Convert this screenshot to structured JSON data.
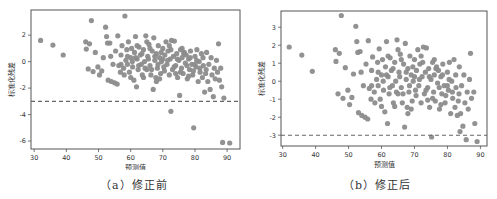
{
  "colors": {
    "point": "#8c8c8c",
    "axis": "#555555",
    "dashed_line": "#666666",
    "text": "#333333"
  },
  "chart_data": [
    {
      "id": "a",
      "type": "scatter",
      "title": "",
      "caption": "（a）修正前",
      "xlabel": "预测值",
      "ylabel": "标准化残差",
      "xlim": [
        29,
        94
      ],
      "ylim": [
        -6.6,
        3.9
      ],
      "xticks": [
        30,
        40,
        50,
        60,
        70,
        80,
        90
      ],
      "yticks": [
        2,
        0,
        -2,
        -4,
        -6
      ],
      "grid": false,
      "legend": null,
      "reference_line": {
        "y": -3,
        "style": "dashed"
      },
      "points": [
        [
          32,
          1.6
        ],
        [
          35.8,
          1.25
        ],
        [
          39,
          0.5
        ],
        [
          46,
          1.5
        ],
        [
          46.2,
          0.95
        ],
        [
          46.8,
          -0.55
        ],
        [
          47.2,
          1.35
        ],
        [
          47.8,
          3.1
        ],
        [
          48.3,
          -0.75
        ],
        [
          49,
          0.7
        ],
        [
          49.8,
          -0.4
        ],
        [
          50.3,
          -1.0
        ],
        [
          51,
          -0.7
        ],
        [
          51.5,
          0.3
        ],
        [
          52.2,
          2.6
        ],
        [
          52.5,
          1.9
        ],
        [
          52.8,
          1.4
        ],
        [
          53,
          -1.4
        ],
        [
          53.5,
          1.4
        ],
        [
          53.8,
          0.4
        ],
        [
          54,
          -1.5
        ],
        [
          54.5,
          -0.2
        ],
        [
          55,
          -1.6
        ],
        [
          55.3,
          0.8
        ],
        [
          55.8,
          -1.7
        ],
        [
          56,
          1.95
        ],
        [
          56.3,
          -0.3
        ],
        [
          56.8,
          -0.8
        ],
        [
          57,
          0.5
        ],
        [
          57.3,
          1.2
        ],
        [
          57.8,
          -0.5
        ],
        [
          58.2,
          3.45
        ],
        [
          58.5,
          0.1
        ],
        [
          58.8,
          0.9
        ],
        [
          59,
          -0.2
        ],
        [
          59.3,
          1.5
        ],
        [
          59.6,
          -0.8
        ],
        [
          60,
          0.3
        ],
        [
          60.3,
          1.0
        ],
        [
          60.6,
          -0.4
        ],
        [
          61,
          -1.4
        ],
        [
          61.2,
          0.7
        ],
        [
          61.5,
          1.9
        ],
        [
          61.8,
          -1.9
        ],
        [
          62,
          0.2
        ],
        [
          62.3,
          -0.6
        ],
        [
          62.6,
          1.1
        ],
        [
          63,
          0.5
        ],
        [
          63.3,
          -0.2
        ],
        [
          63.6,
          -1.0
        ],
        [
          64,
          0.9
        ],
        [
          64.3,
          0.0
        ],
        [
          64.7,
          1.95
        ],
        [
          65,
          -0.6
        ],
        [
          65.3,
          0.4
        ],
        [
          65.7,
          1.3
        ],
        [
          66,
          -0.3
        ],
        [
          66.3,
          -1.0
        ],
        [
          66.7,
          0.8
        ],
        [
          67,
          -2.1
        ],
        [
          67.2,
          1.8
        ],
        [
          67.5,
          0.1
        ],
        [
          67.8,
          -1.2
        ],
        [
          68,
          0.6
        ],
        [
          68.3,
          -0.5
        ],
        [
          68.6,
          1.2
        ],
        [
          69,
          0.3
        ],
        [
          69.3,
          -0.9
        ],
        [
          69.6,
          0.0
        ],
        [
          70,
          1.0
        ],
        [
          70.3,
          -0.4
        ],
        [
          70.6,
          0.5
        ],
        [
          71,
          1.5
        ],
        [
          71.3,
          -0.2
        ],
        [
          71.6,
          0.8
        ],
        [
          72,
          -1.0
        ],
        [
          72.3,
          0.2
        ],
        [
          72.5,
          -3.75
        ],
        [
          72.7,
          1.6
        ],
        [
          73,
          -0.6
        ],
        [
          73.3,
          0.4
        ],
        [
          73.6,
          1.55
        ],
        [
          74,
          -0.3
        ],
        [
          74.3,
          0.6
        ],
        [
          74.6,
          -1.2
        ],
        [
          75,
          0.1
        ],
        [
          75.2,
          -2.55
        ],
        [
          75.5,
          0.9
        ],
        [
          75.8,
          -0.5
        ],
        [
          76,
          0.3
        ],
        [
          76.3,
          -0.9
        ],
        [
          76.7,
          0.7
        ],
        [
          77,
          -0.1
        ],
        [
          77.3,
          0.5
        ],
        [
          77.6,
          -1.3
        ],
        [
          78,
          0.2
        ],
        [
          78.3,
          -0.6
        ],
        [
          78.6,
          0.8
        ],
        [
          79,
          -0.2
        ],
        [
          79.3,
          -1.0
        ],
        [
          79.6,
          -5.0
        ],
        [
          80,
          0.4
        ],
        [
          80.3,
          -0.4
        ],
        [
          80.6,
          0.9
        ],
        [
          81,
          -1.5
        ],
        [
          81.3,
          0.0
        ],
        [
          81.6,
          -0.8
        ],
        [
          82,
          0.6
        ],
        [
          82.3,
          -1.2
        ],
        [
          82.6,
          -0.3
        ],
        [
          83,
          -2.3
        ],
        [
          83.3,
          -0.9
        ],
        [
          83.6,
          0.7
        ],
        [
          84,
          -1.5
        ],
        [
          84.3,
          -0.2
        ],
        [
          84.7,
          -2.1
        ],
        [
          85,
          0.3
        ],
        [
          85.3,
          -1.0
        ],
        [
          85.7,
          -2.65
        ],
        [
          86,
          -0.5
        ],
        [
          86.3,
          -1.3
        ],
        [
          86.7,
          0.1
        ],
        [
          87,
          -0.8
        ],
        [
          87.3,
          1.35
        ],
        [
          87.6,
          -1.4
        ],
        [
          88,
          -0.5
        ],
        [
          88.3,
          -1.9
        ],
        [
          88.6,
          -6.1
        ],
        [
          89,
          -2.75
        ],
        [
          90.8,
          -6.15
        ],
        [
          60.5,
          0.0
        ],
        [
          61.5,
          0.3
        ],
        [
          62.5,
          -0.3
        ],
        [
          63.5,
          0.6
        ],
        [
          64.5,
          -0.5
        ],
        [
          65.5,
          0.2
        ],
        [
          66.5,
          -0.6
        ],
        [
          67.5,
          0.4
        ],
        [
          68.5,
          -0.2
        ],
        [
          69.5,
          0.7
        ],
        [
          70.5,
          -0.7
        ],
        [
          71.5,
          0.1
        ],
        [
          72.5,
          0.9
        ],
        [
          73.5,
          -0.4
        ],
        [
          74.5,
          0.2
        ],
        [
          75.5,
          -0.8
        ],
        [
          76.5,
          0.6
        ],
        [
          77.5,
          -0.3
        ],
        [
          78.5,
          0.3
        ],
        [
          79.5,
          -0.7
        ],
        [
          80.5,
          0.1
        ],
        [
          81.5,
          -0.5
        ],
        [
          82.5,
          0.3
        ],
        [
          83.5,
          -0.6
        ],
        [
          62,
          1.2
        ],
        [
          64,
          -1.2
        ],
        [
          66,
          1.0
        ],
        [
          68,
          -1.5
        ],
        [
          70,
          0.2
        ],
        [
          72,
          1.2
        ],
        [
          74,
          -0.9
        ],
        [
          76,
          1.0
        ],
        [
          78,
          -1.1
        ],
        [
          80,
          -0.2
        ],
        [
          58,
          -1.0
        ],
        [
          57,
          -0.2
        ],
        [
          59,
          0.4
        ],
        [
          60,
          -1.2
        ],
        [
          65,
          1.5
        ],
        [
          69,
          -1.3
        ]
      ]
    },
    {
      "id": "b",
      "type": "scatter",
      "title": "",
      "caption": "（b）修正后",
      "xlabel": "预测值",
      "ylabel": "标准化残差",
      "xlim": [
        29.5,
        92
      ],
      "ylim": [
        -3.6,
        3.9
      ],
      "xticks": [
        30,
        40,
        50,
        60,
        70,
        80,
        90
      ],
      "yticks": [
        3,
        2,
        1,
        0,
        -1,
        -2,
        -3
      ],
      "grid": false,
      "legend": null,
      "reference_line": {
        "y": -3,
        "style": "dashed"
      },
      "points": [
        [
          32,
          1.9
        ],
        [
          35.8,
          1.45
        ],
        [
          39,
          0.55
        ],
        [
          46,
          1.75
        ],
        [
          46.2,
          1.1
        ],
        [
          46.8,
          -0.7
        ],
        [
          47.2,
          1.55
        ],
        [
          47.8,
          3.65
        ],
        [
          48.3,
          -0.95
        ],
        [
          49,
          0.75
        ],
        [
          49.8,
          -0.5
        ],
        [
          50.3,
          -1.3
        ],
        [
          51,
          -0.9
        ],
        [
          51.5,
          0.4
        ],
        [
          52.2,
          3.05
        ],
        [
          52.5,
          2.2
        ],
        [
          52.8,
          1.6
        ],
        [
          53,
          -1.75
        ],
        [
          53.5,
          1.65
        ],
        [
          53.8,
          0.5
        ],
        [
          54,
          -1.9
        ],
        [
          54.5,
          -0.25
        ],
        [
          55,
          -2.0
        ],
        [
          55.3,
          0.95
        ],
        [
          55.8,
          -2.1
        ],
        [
          56,
          2.25
        ],
        [
          56.3,
          -0.4
        ],
        [
          56.8,
          -1.0
        ],
        [
          57,
          0.6
        ],
        [
          57.3,
          1.35
        ],
        [
          57.8,
          -0.6
        ],
        [
          58.5,
          0.1
        ],
        [
          58.8,
          1.05
        ],
        [
          59,
          -0.25
        ],
        [
          59.3,
          1.8
        ],
        [
          59.6,
          -1.0
        ],
        [
          60,
          0.35
        ],
        [
          60.3,
          1.2
        ],
        [
          60.6,
          -0.5
        ],
        [
          61,
          -1.7
        ],
        [
          61.2,
          0.8
        ],
        [
          61.5,
          2.2
        ],
        [
          61.8,
          -2.35
        ],
        [
          62,
          0.25
        ],
        [
          62.3,
          -0.7
        ],
        [
          62.6,
          1.3
        ],
        [
          63,
          0.6
        ],
        [
          63.3,
          -0.25
        ],
        [
          63.6,
          -1.2
        ],
        [
          64,
          1.05
        ],
        [
          64.3,
          0.0
        ],
        [
          64.7,
          2.3
        ],
        [
          65,
          -0.7
        ],
        [
          65.3,
          0.5
        ],
        [
          65.7,
          1.5
        ],
        [
          66,
          -0.35
        ],
        [
          66.3,
          -1.2
        ],
        [
          66.7,
          0.95
        ],
        [
          67,
          -2.55
        ],
        [
          67.2,
          2.1
        ],
        [
          67.5,
          0.1
        ],
        [
          67.8,
          -1.45
        ],
        [
          68,
          0.7
        ],
        [
          68.3,
          -0.6
        ],
        [
          68.6,
          1.4
        ],
        [
          69,
          0.35
        ],
        [
          69.3,
          -1.1
        ],
        [
          69.6,
          0.0
        ],
        [
          70,
          1.2
        ],
        [
          70.3,
          -0.5
        ],
        [
          70.6,
          0.6
        ],
        [
          71,
          1.75
        ],
        [
          71.3,
          -0.25
        ],
        [
          71.6,
          0.95
        ],
        [
          72,
          -1.2
        ],
        [
          72.3,
          0.25
        ],
        [
          72.7,
          1.9
        ],
        [
          73,
          -0.7
        ],
        [
          73.3,
          0.5
        ],
        [
          73.6,
          1.85
        ],
        [
          74,
          -0.35
        ],
        [
          74.3,
          0.7
        ],
        [
          74.6,
          -1.45
        ],
        [
          75,
          0.1
        ],
        [
          75.2,
          -3.1
        ],
        [
          75.5,
          1.05
        ],
        [
          75.8,
          -0.6
        ],
        [
          76,
          0.35
        ],
        [
          76.3,
          -1.1
        ],
        [
          76.7,
          0.8
        ],
        [
          77,
          -0.1
        ],
        [
          77.3,
          0.6
        ],
        [
          77.6,
          -1.55
        ],
        [
          78,
          0.25
        ],
        [
          78.3,
          -0.7
        ],
        [
          78.6,
          0.95
        ],
        [
          79,
          -0.25
        ],
        [
          79.3,
          -1.2
        ],
        [
          80,
          0.5
        ],
        [
          80.3,
          -0.5
        ],
        [
          80.6,
          1.05
        ],
        [
          81,
          -1.8
        ],
        [
          81.3,
          0.0
        ],
        [
          81.6,
          -0.95
        ],
        [
          82,
          1.2
        ],
        [
          82.3,
          -1.45
        ],
        [
          82.6,
          -0.35
        ],
        [
          83,
          -1.9
        ],
        [
          83.3,
          -1.1
        ],
        [
          83.6,
          0.8
        ],
        [
          83.8,
          -2.8
        ],
        [
          84,
          -1.8
        ],
        [
          84.3,
          -0.25
        ],
        [
          84.7,
          -2.5
        ],
        [
          85,
          0.35
        ],
        [
          85.3,
          -1.2
        ],
        [
          85.7,
          -3.25
        ],
        [
          86,
          -0.6
        ],
        [
          86.3,
          -1.55
        ],
        [
          86.7,
          0.1
        ],
        [
          87,
          1.55
        ],
        [
          87.3,
          -0.95
        ],
        [
          88,
          -0.6
        ],
        [
          88.3,
          -2.35
        ],
        [
          89,
          -3.35
        ],
        [
          60.5,
          0.0
        ],
        [
          61.5,
          0.35
        ],
        [
          62.5,
          -0.35
        ],
        [
          63.5,
          0.7
        ],
        [
          64.5,
          -0.6
        ],
        [
          65.5,
          0.25
        ],
        [
          66.5,
          -0.7
        ],
        [
          67.5,
          0.5
        ],
        [
          68.5,
          -0.25
        ],
        [
          69.5,
          0.8
        ],
        [
          70.5,
          -0.8
        ],
        [
          71.5,
          0.1
        ],
        [
          72.5,
          1.05
        ],
        [
          73.5,
          -0.5
        ],
        [
          74.5,
          0.25
        ],
        [
          75.5,
          -0.95
        ],
        [
          76.5,
          0.7
        ],
        [
          77.5,
          -0.35
        ],
        [
          78.5,
          0.35
        ],
        [
          79.5,
          -0.8
        ],
        [
          80.5,
          0.1
        ],
        [
          81.5,
          -0.6
        ],
        [
          82.5,
          0.35
        ],
        [
          83.5,
          -0.7
        ],
        [
          62,
          1.4
        ],
        [
          64,
          -1.4
        ],
        [
          66,
          1.2
        ],
        [
          68,
          -1.8
        ],
        [
          70,
          0.25
        ],
        [
          72,
          1.4
        ],
        [
          74,
          -1.05
        ],
        [
          76,
          1.2
        ],
        [
          78,
          -1.3
        ],
        [
          80,
          -0.25
        ],
        [
          58,
          -1.2
        ],
        [
          57,
          -0.25
        ],
        [
          59,
          0.5
        ],
        [
          60,
          -1.4
        ],
        [
          65,
          1.75
        ],
        [
          69,
          -1.55
        ]
      ]
    }
  ]
}
